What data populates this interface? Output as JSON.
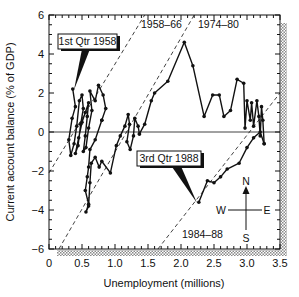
{
  "chart_data": {
    "type": "line",
    "title": "",
    "xlabel": "Unemployment (millions)",
    "ylabel": "Current account balance (% of GDP)",
    "xlim": [
      0,
      3.5
    ],
    "ylim": [
      -6,
      6
    ],
    "x_ticks": [
      0,
      0.5,
      1.0,
      1.5,
      2.0,
      2.5,
      3.0,
      3.5
    ],
    "x_tick_labels": [
      "0",
      "0.5",
      "1.0",
      "1.5",
      "2.0",
      "2.5",
      "3.0",
      "3.5"
    ],
    "y_ticks": [
      -6,
      -4,
      -2,
      0,
      2,
      4,
      6
    ],
    "y_tick_labels": [
      "−6",
      "−4",
      "−2",
      "0",
      "2",
      "4",
      "6"
    ],
    "grid": false,
    "zero_line": true,
    "series": [
      {
        "name": "1958-1966 (quarterly)",
        "points": [
          [
            0.36,
            2.2
          ],
          [
            0.4,
            1.3
          ],
          [
            0.35,
            0.7
          ],
          [
            0.3,
            -0.4
          ],
          [
            0.33,
            -1.2
          ],
          [
            0.38,
            -0.6
          ],
          [
            0.42,
            0.3
          ],
          [
            0.46,
            1.6
          ],
          [
            0.5,
            1.9
          ],
          [
            0.52,
            1.2
          ],
          [
            0.48,
            0.4
          ],
          [
            0.44,
            -0.7
          ],
          [
            0.4,
            -1.1
          ],
          [
            0.45,
            -0.3
          ],
          [
            0.5,
            0.5
          ],
          [
            0.55,
            1.0
          ],
          [
            0.6,
            1.5
          ],
          [
            0.58,
            0.8
          ],
          [
            0.55,
            -0.2
          ],
          [
            0.52,
            -1.0
          ],
          [
            0.56,
            -0.8
          ],
          [
            0.6,
            0.2
          ],
          [
            0.65,
            1.1
          ],
          [
            0.62,
            2.1
          ],
          [
            0.7,
            1.6
          ],
          [
            0.75,
            2.4
          ],
          [
            0.82,
            1.9
          ],
          [
            0.86,
            1.2
          ],
          [
            0.8,
            0.6
          ]
        ]
      },
      {
        "name": "1966-1974 (quarterly)",
        "points": [
          [
            0.8,
            0.6
          ],
          [
            0.7,
            -0.4
          ],
          [
            0.62,
            -0.9
          ],
          [
            0.6,
            -1.8
          ],
          [
            0.58,
            -2.3
          ],
          [
            0.55,
            -3.0
          ],
          [
            0.6,
            -3.7
          ],
          [
            0.56,
            -4.1
          ],
          [
            0.6,
            -3.8
          ],
          [
            0.62,
            -2.6
          ],
          [
            0.64,
            -1.6
          ],
          [
            0.7,
            -1.3
          ],
          [
            0.76,
            -1.8
          ],
          [
            0.8,
            -1.5
          ],
          [
            0.93,
            -2.1
          ],
          [
            1.02,
            -0.7
          ],
          [
            1.08,
            -0.2
          ],
          [
            1.15,
            0.3
          ],
          [
            1.2,
            0.9
          ],
          [
            1.22,
            0.4
          ],
          [
            1.18,
            -0.5
          ],
          [
            1.23,
            -0.9
          ],
          [
            1.28,
            -0.2
          ],
          [
            1.3,
            0.7
          ],
          [
            1.35,
            0.3
          ],
          [
            1.37,
            -0.1
          ]
        ]
      },
      {
        "name": "1974-1984 (quarterly)",
        "points": [
          [
            1.37,
            -0.1
          ],
          [
            1.45,
            0.4
          ],
          [
            1.55,
            1.6
          ],
          [
            1.6,
            2.0
          ],
          [
            1.8,
            2.6
          ],
          [
            2.05,
            4.6
          ],
          [
            2.18,
            3.4
          ],
          [
            2.35,
            0.8
          ],
          [
            2.48,
            1.9
          ],
          [
            2.58,
            1.9
          ],
          [
            2.65,
            0.8
          ],
          [
            2.75,
            1.1
          ],
          [
            2.85,
            2.7
          ],
          [
            2.95,
            2.5
          ],
          [
            2.97,
            0.2
          ],
          [
            3.0,
            1.6
          ],
          [
            3.05,
            0.6
          ],
          [
            3.07,
            1.5
          ],
          [
            3.1,
            0.3
          ],
          [
            3.15,
            1.6
          ],
          [
            3.18,
            0.8
          ],
          [
            3.2,
            -0.2
          ],
          [
            3.22,
            1.3
          ],
          [
            3.24,
            0.6
          ],
          [
            3.26,
            -0.6
          ]
        ]
      },
      {
        "name": "1984-1988 (quarterly)",
        "points": [
          [
            3.26,
            -0.6
          ],
          [
            3.2,
            0.0
          ],
          [
            3.1,
            -0.3
          ],
          [
            3.0,
            -0.8
          ],
          [
            2.88,
            -1.6
          ],
          [
            2.7,
            -1.9
          ],
          [
            2.6,
            -2.3
          ],
          [
            2.5,
            -2.6
          ],
          [
            2.4,
            -2.5
          ],
          [
            2.27,
            -3.6
          ]
        ]
      }
    ],
    "trend_lines": [
      {
        "label": "1958–66",
        "style": "dashed",
        "from": [
          0.0,
          -2.1
        ],
        "to": [
          1.45,
          6.0
        ]
      },
      {
        "label": "1974–80",
        "style": "dashed",
        "from": [
          0.15,
          -6.0
        ],
        "to": [
          2.2,
          6.0
        ]
      },
      {
        "label": "1984–88",
        "style": "dashed",
        "from": [
          1.65,
          -6.0
        ],
        "to": [
          3.5,
          2.0
        ]
      }
    ],
    "annotations": [
      {
        "text": "1st Qtr 1958",
        "box": true,
        "points_to": [
          0.36,
          2.2
        ]
      },
      {
        "text": "3rd Qtr 1988",
        "box": true,
        "points_to": [
          2.27,
          -3.6
        ]
      },
      {
        "text": "1958–66",
        "at": [
          1.35,
          5.4
        ]
      },
      {
        "text": "1974–80",
        "at": [
          2.2,
          5.4
        ]
      },
      {
        "text": "1984–88",
        "at": [
          2.25,
          -5.1
        ]
      }
    ],
    "compass": {
      "north": "N",
      "south": "S",
      "east": "E",
      "west": "W"
    }
  },
  "labels": {
    "xlabel": "Unemployment (millions)",
    "ylabel": "Current account balance (% of GDP)",
    "callout_1": "1st Qtr 1958",
    "callout_2": "3rd Qtr 1988",
    "line_1958": "1958–66",
    "line_1974": "1974–80",
    "line_1984": "1984–88",
    "compass_n": "N",
    "compass_s": "S",
    "compass_e": "E",
    "compass_w": "W"
  },
  "colors": {
    "ink": "#111111",
    "shadow_pattern": "#9a9a9a",
    "background": "#ffffff"
  }
}
